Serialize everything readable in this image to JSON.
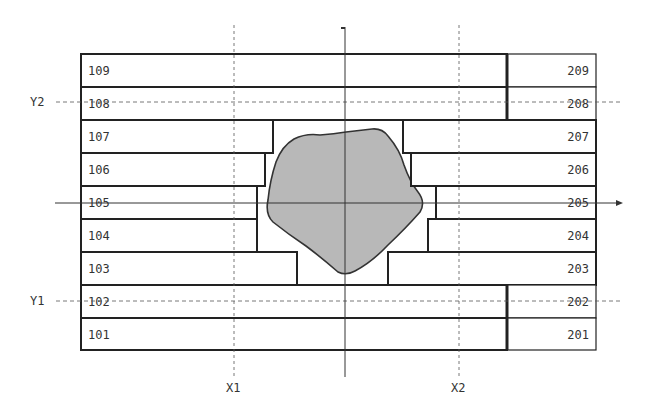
{
  "diagram": {
    "left_boxes": [
      {
        "label": "109",
        "y": 54,
        "right": 507
      },
      {
        "label": "108",
        "y": 87,
        "right": 507
      },
      {
        "label": "107",
        "y": 120,
        "right": 273
      },
      {
        "label": "106",
        "y": 153,
        "right": 265
      },
      {
        "label": "105",
        "y": 186,
        "right": 257
      },
      {
        "label": "104",
        "y": 219,
        "right": 257
      },
      {
        "label": "103",
        "y": 252,
        "right": 297
      },
      {
        "label": "102",
        "y": 285,
        "right": 507
      },
      {
        "label": "101",
        "y": 318,
        "right": 507
      }
    ],
    "right_boxes": [
      {
        "label": "209",
        "y": 54,
        "left": 507
      },
      {
        "label": "208",
        "y": 87,
        "left": 507
      },
      {
        "label": "207",
        "y": 120,
        "left": 403
      },
      {
        "label": "206",
        "y": 153,
        "left": 411
      },
      {
        "label": "205",
        "y": 186,
        "left": 436
      },
      {
        "label": "204",
        "y": 219,
        "left": 428
      },
      {
        "label": "203",
        "y": 252,
        "left": 388
      },
      {
        "label": "202",
        "y": 285,
        "left": 507
      },
      {
        "label": "201",
        "y": 318,
        "left": 507
      }
    ],
    "guides": {
      "x1": "X1",
      "x2": "X2",
      "y1": "Y1",
      "y2": "Y2"
    },
    "colors": {
      "blob_fill": "#b8b8b8",
      "stroke": "#222222",
      "guide": "#555555"
    }
  }
}
